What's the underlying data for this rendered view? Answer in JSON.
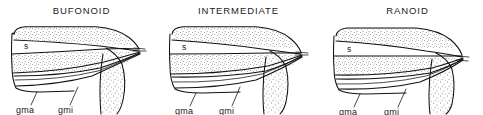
{
  "figure": {
    "caption_present": false,
    "background_color": "#ffffff",
    "ink_color": "#111111",
    "style": "line-drawing-with-stipple-shading"
  },
  "panels": [
    {
      "id": "bufonoid",
      "title": "BUFONOID",
      "labels": {
        "sartorius": "s",
        "gracilis_major": "gma",
        "gracilis_minor": "gmi"
      }
    },
    {
      "id": "intermediate",
      "title": "INTERMEDIATE",
      "labels": {
        "sartorius": "s",
        "gracilis_major": "gma",
        "gracilis_minor": "gmi"
      }
    },
    {
      "id": "ranoid",
      "title": "RANOID",
      "labels": {
        "sartorius": "s",
        "gracilis_major": "gma",
        "gracilis_minor": "gmi"
      }
    }
  ]
}
